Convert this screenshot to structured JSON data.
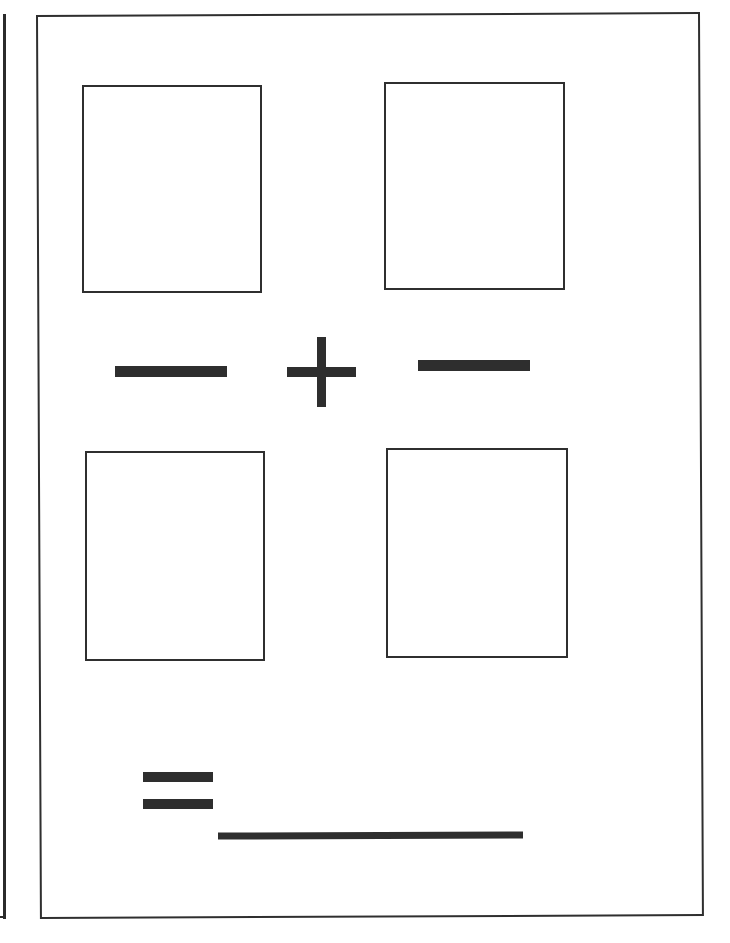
{
  "worksheet": {
    "description": "Empty arithmetic worksheet frame with four blank boxes and operator symbols",
    "operators": {
      "left": "minus",
      "center": "plus",
      "right": "minus",
      "result": "equals"
    },
    "boxes": [
      {
        "position": "top-left",
        "content": ""
      },
      {
        "position": "top-right",
        "content": ""
      },
      {
        "position": "bottom-left",
        "content": ""
      },
      {
        "position": "bottom-right",
        "content": ""
      }
    ],
    "answer_line": {
      "content": ""
    },
    "colors": {
      "ink": "#2e2e2e",
      "paper": "#ffffff"
    }
  }
}
